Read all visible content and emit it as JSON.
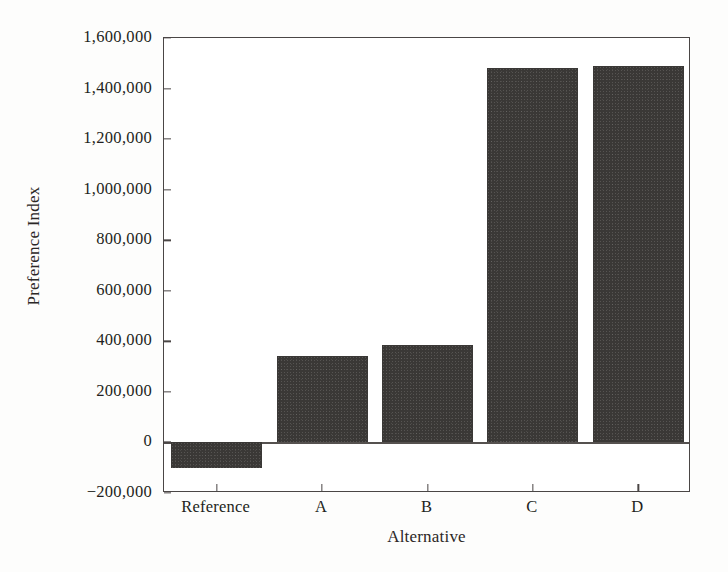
{
  "chart_data": {
    "type": "bar",
    "title": "",
    "xlabel": "Alternative",
    "ylabel": "Preference Index",
    "categories": [
      "Reference",
      "A",
      "B",
      "C",
      "D"
    ],
    "values": [
      -100000,
      342000,
      385000,
      1480000,
      1490000
    ],
    "ylim": [
      -200000,
      1600000
    ],
    "ytick_values": [
      1600000,
      1400000,
      1200000,
      1000000,
      800000,
      600000,
      400000,
      200000,
      0,
      -200000
    ],
    "ytick_labels": [
      "1,600,000",
      "1,400,000",
      "1,200,000",
      "1,000,000",
      "800,000",
      "600,000",
      "400,000",
      "200,000",
      "0",
      "−200,000"
    ],
    "grid": false,
    "legend": null,
    "bar_color": "#3a3836",
    "axis_color": "#4a4645",
    "background_color": "#ffffff"
  }
}
